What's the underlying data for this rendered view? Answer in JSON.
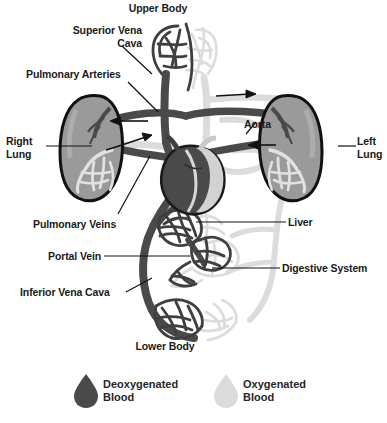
{
  "diagram": {
    "colors": {
      "deoxygenated": "#4a4a4a",
      "deoxygenated_dark": "#3d3d3d",
      "oxygenated": "#dcdcdc",
      "oxygenated_mid": "#c9c9c9",
      "lung_fill": "#9a9a9a",
      "outline": "#111111",
      "background": "#ffffff",
      "text": "#1a1a1a"
    },
    "labels": [
      {
        "name": "upper-body",
        "text": "Upper Body",
        "x": 158,
        "y": 2,
        "align": "center"
      },
      {
        "name": "superior-vena-cava",
        "text": "Superior Vena\nCava",
        "x": 66,
        "y": 24,
        "align": "right"
      },
      {
        "name": "pulmonary-arteries",
        "text": "Pulmonary Arteries",
        "x": 26,
        "y": 68,
        "align": "left"
      },
      {
        "name": "right-lung",
        "text": "Right\nLung",
        "x": 6,
        "y": 135,
        "align": "left"
      },
      {
        "name": "aorta",
        "text": "Aorta",
        "x": 244,
        "y": 118,
        "align": "left"
      },
      {
        "name": "left-lung",
        "text": "Left\nLung",
        "x": 357,
        "y": 135,
        "align": "left"
      },
      {
        "name": "pulmonary-veins",
        "text": "Pulmonary Veins",
        "x": 33,
        "y": 218,
        "align": "left"
      },
      {
        "name": "liver",
        "text": "Liver",
        "x": 288,
        "y": 222,
        "align": "left"
      },
      {
        "name": "portal-vein",
        "text": "Portal Vein",
        "x": 48,
        "y": 252,
        "align": "left"
      },
      {
        "name": "digestive-system",
        "text": "Digestive System",
        "x": 282,
        "y": 268,
        "align": "left"
      },
      {
        "name": "inferior-vena-cava",
        "text": "Inferior Vena Cava",
        "x": 20,
        "y": 288,
        "align": "left"
      },
      {
        "name": "lower-body",
        "text": "Lower Body",
        "x": 165,
        "y": 340,
        "align": "center"
      }
    ],
    "legend": {
      "items": [
        {
          "name": "deoxygenated-blood",
          "text": "Deoxygenated\nBlood",
          "color": "#4a4a4a",
          "drop_x": 78,
          "drop_y": 374,
          "text_x": 95,
          "text_y": 377
        },
        {
          "name": "oxygenated-blood",
          "text": "Oxygenated\nBlood",
          "color": "#dcdcdc",
          "drop_x": 218,
          "drop_y": 374,
          "text_x": 235,
          "text_y": 377
        }
      ]
    },
    "structures": [
      {
        "name": "right-lung-organ",
        "type": "organ",
        "side": "right-of-viewer"
      },
      {
        "name": "left-lung-organ",
        "type": "organ",
        "side": "left-of-viewer"
      },
      {
        "name": "heart-organ",
        "type": "organ"
      },
      {
        "name": "upper-body-capillaries",
        "type": "capillary-bed"
      },
      {
        "name": "lower-body-capillaries",
        "type": "capillary-bed"
      },
      {
        "name": "liver-capillaries",
        "type": "capillary-bed"
      },
      {
        "name": "digestive-capillaries",
        "type": "capillary-bed"
      }
    ],
    "flow_arrows": [
      {
        "name": "arrow-pulmonary-artery-right",
        "direction": "left",
        "x": 105,
        "y": 120
      },
      {
        "name": "arrow-pulmonary-vein-right",
        "direction": "right",
        "x": 110,
        "y": 143
      },
      {
        "name": "arrow-aorta-top",
        "direction": "right",
        "x": 232,
        "y": 96
      },
      {
        "name": "arrow-aorta-left",
        "direction": "left",
        "x": 262,
        "y": 145
      }
    ]
  }
}
